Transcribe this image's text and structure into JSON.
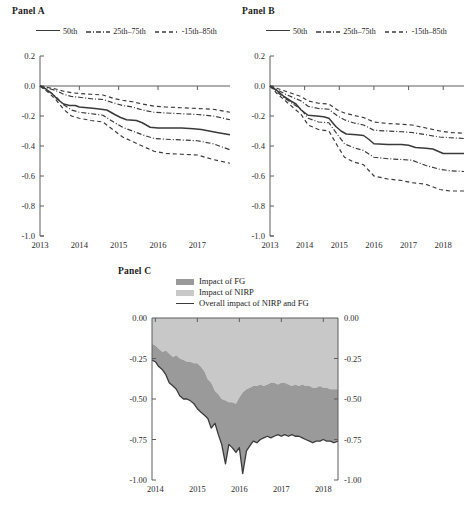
{
  "figure": {
    "panels": [
      "Panel A",
      "Panel B",
      "Panel C"
    ]
  },
  "panel_a": {
    "title": "Panel A",
    "legend": [
      {
        "label": "50th",
        "style": "solid"
      },
      {
        "label": "25th–75th",
        "style": "dash-dot"
      },
      {
        "label": "-15th–85th",
        "style": "dashed"
      }
    ]
  },
  "panel_b": {
    "title": "Panel B",
    "legend": [
      {
        "label": "50th",
        "style": "solid"
      },
      {
        "label": "25th–75th",
        "style": "dash-dot"
      },
      {
        "label": "-15th–85th",
        "style": "dashed"
      }
    ]
  },
  "panel_c": {
    "title": "Panel C",
    "legend": [
      {
        "label": "Impact of FG",
        "style": "area",
        "color": "#9a9a9a"
      },
      {
        "label": "Impact of NIRP",
        "style": "area",
        "color": "#c8c8c8"
      },
      {
        "label": "Overall impact of NIRP and FG",
        "style": "line",
        "color": "#3a3a3a"
      }
    ]
  },
  "chart_data": [
    {
      "id": "panel_a",
      "type": "line",
      "title": "Panel A",
      "xlabel": "",
      "ylabel": "",
      "xlim": [
        2013.0,
        2017.83
      ],
      "ylim": [
        -1.0,
        0.2
      ],
      "xticks": [
        "2013",
        "2014",
        "2015",
        "2016",
        "2017"
      ],
      "xtick_values": [
        2013,
        2014,
        2015,
        2016,
        2017
      ],
      "yticks": [
        "0.2",
        "0.0",
        "-0.2",
        "-0.4",
        "-0.6",
        "-0.8",
        "-1.0"
      ],
      "ytick_values": [
        0.2,
        0.0,
        -0.2,
        -0.4,
        -0.6,
        -0.8,
        -1.0
      ],
      "grid": false,
      "legend_position": "top",
      "zero_line": 0.0,
      "series": [
        {
          "name": "50th",
          "style": "solid",
          "x": [
            2013.0,
            2013.15,
            2013.3,
            2013.45,
            2013.6,
            2013.75,
            2013.9,
            2014.0,
            2014.2,
            2014.4,
            2014.55,
            2014.7,
            2014.9,
            2015.05,
            2015.2,
            2015.45,
            2015.6,
            2015.8,
            2016.0,
            2016.3,
            2016.6,
            2016.9,
            2017.1,
            2017.3,
            2017.5,
            2017.83
          ],
          "values": [
            0.0,
            -0.02,
            -0.05,
            -0.09,
            -0.12,
            -0.13,
            -0.13,
            -0.14,
            -0.145,
            -0.15,
            -0.155,
            -0.16,
            -0.19,
            -0.21,
            -0.225,
            -0.23,
            -0.245,
            -0.275,
            -0.28,
            -0.28,
            -0.28,
            -0.285,
            -0.29,
            -0.3,
            -0.31,
            -0.325
          ]
        },
        {
          "name": "75th",
          "style": "dash-dot",
          "x": [
            2013.0,
            2013.2,
            2013.4,
            2013.6,
            2013.8,
            2014.0,
            2014.3,
            2014.6,
            2014.9,
            2015.1,
            2015.35,
            2015.6,
            2015.9,
            2016.2,
            2016.6,
            2017.0,
            2017.4,
            2017.83
          ],
          "values": [
            0.0,
            -0.015,
            -0.03,
            -0.055,
            -0.07,
            -0.075,
            -0.085,
            -0.09,
            -0.115,
            -0.13,
            -0.14,
            -0.16,
            -0.175,
            -0.18,
            -0.185,
            -0.19,
            -0.2,
            -0.225
          ]
        },
        {
          "name": "25th",
          "style": "dash-dot",
          "x": [
            2013.0,
            2013.2,
            2013.4,
            2013.6,
            2013.8,
            2014.0,
            2014.3,
            2014.6,
            2014.9,
            2015.1,
            2015.35,
            2015.6,
            2015.9,
            2016.2,
            2016.6,
            2017.0,
            2017.4,
            2017.83
          ],
          "values": [
            0.0,
            -0.03,
            -0.07,
            -0.125,
            -0.16,
            -0.175,
            -0.185,
            -0.195,
            -0.245,
            -0.275,
            -0.3,
            -0.325,
            -0.35,
            -0.355,
            -0.36,
            -0.365,
            -0.385,
            -0.425
          ]
        },
        {
          "name": "85th",
          "style": "dashed",
          "x": [
            2013.0,
            2013.2,
            2013.4,
            2013.6,
            2013.8,
            2014.0,
            2014.3,
            2014.6,
            2014.9,
            2015.1,
            2015.35,
            2015.6,
            2015.9,
            2016.2,
            2016.6,
            2017.0,
            2017.4,
            2017.83
          ],
          "values": [
            0.0,
            -0.01,
            -0.02,
            -0.035,
            -0.045,
            -0.05,
            -0.055,
            -0.06,
            -0.085,
            -0.095,
            -0.105,
            -0.12,
            -0.135,
            -0.14,
            -0.145,
            -0.15,
            -0.155,
            -0.175
          ]
        },
        {
          "name": "15th",
          "style": "dashed",
          "x": [
            2013.0,
            2013.2,
            2013.4,
            2013.6,
            2013.8,
            2014.0,
            2014.3,
            2014.6,
            2014.9,
            2015.1,
            2015.35,
            2015.6,
            2015.9,
            2016.2,
            2016.6,
            2017.0,
            2017.4,
            2017.83
          ],
          "values": [
            0.0,
            -0.04,
            -0.09,
            -0.155,
            -0.2,
            -0.215,
            -0.23,
            -0.24,
            -0.3,
            -0.34,
            -0.37,
            -0.4,
            -0.435,
            -0.45,
            -0.455,
            -0.46,
            -0.49,
            -0.515
          ]
        }
      ]
    },
    {
      "id": "panel_b",
      "type": "line",
      "title": "Panel B",
      "xlabel": "",
      "ylabel": "",
      "xlim": [
        2013.0,
        2018.6
      ],
      "ylim": [
        -1.0,
        0.2
      ],
      "xticks": [
        "2013",
        "2014",
        "2015",
        "2016",
        "2017",
        "2018"
      ],
      "xtick_values": [
        2013,
        2014,
        2015,
        2016,
        2017,
        2018
      ],
      "yticks": [
        "0.2",
        "0.0",
        "-0.2",
        "-0.4",
        "-0.6",
        "-0.8",
        "-1.0"
      ],
      "ytick_values": [
        0.2,
        0.0,
        -0.2,
        -0.4,
        -0.6,
        -0.8,
        -1.0
      ],
      "grid": false,
      "legend_position": "top",
      "zero_line": 0.0,
      "series": [
        {
          "name": "50th",
          "style": "solid",
          "x": [
            2013.0,
            2013.2,
            2013.4,
            2013.6,
            2013.75,
            2013.9,
            2014.1,
            2014.35,
            2014.55,
            2014.7,
            2014.9,
            2015.05,
            2015.2,
            2015.5,
            2015.7,
            2015.85,
            2016.0,
            2016.4,
            2016.8,
            2017.0,
            2017.2,
            2017.5,
            2017.7,
            2018.0,
            2018.3,
            2018.6
          ],
          "values": [
            0.0,
            -0.03,
            -0.07,
            -0.1,
            -0.12,
            -0.16,
            -0.195,
            -0.2,
            -0.205,
            -0.215,
            -0.27,
            -0.3,
            -0.32,
            -0.325,
            -0.33,
            -0.355,
            -0.385,
            -0.39,
            -0.39,
            -0.395,
            -0.41,
            -0.415,
            -0.42,
            -0.45,
            -0.45,
            -0.45
          ]
        },
        {
          "name": "75th",
          "style": "dash-dot",
          "x": [
            2013.0,
            2013.2,
            2013.45,
            2013.7,
            2013.9,
            2014.1,
            2014.4,
            2014.7,
            2014.95,
            2015.15,
            2015.4,
            2015.7,
            2016.0,
            2016.4,
            2016.8,
            2017.1,
            2017.5,
            2017.9,
            2018.2,
            2018.6
          ],
          "values": [
            0.0,
            -0.025,
            -0.055,
            -0.08,
            -0.1,
            -0.135,
            -0.15,
            -0.155,
            -0.2,
            -0.225,
            -0.245,
            -0.26,
            -0.295,
            -0.3,
            -0.305,
            -0.31,
            -0.325,
            -0.34,
            -0.345,
            -0.35
          ]
        },
        {
          "name": "25th",
          "style": "dash-dot",
          "x": [
            2013.0,
            2013.2,
            2013.45,
            2013.7,
            2013.9,
            2014.1,
            2014.4,
            2014.7,
            2014.95,
            2015.15,
            2015.4,
            2015.7,
            2016.0,
            2016.4,
            2016.8,
            2017.1,
            2017.5,
            2017.9,
            2018.2,
            2018.6
          ],
          "values": [
            0.0,
            -0.04,
            -0.085,
            -0.125,
            -0.155,
            -0.215,
            -0.24,
            -0.245,
            -0.325,
            -0.385,
            -0.41,
            -0.43,
            -0.475,
            -0.485,
            -0.49,
            -0.495,
            -0.53,
            -0.555,
            -0.565,
            -0.57
          ]
        },
        {
          "name": "85th",
          "style": "dashed",
          "x": [
            2013.0,
            2013.2,
            2013.45,
            2013.7,
            2013.9,
            2014.1,
            2014.4,
            2014.7,
            2014.95,
            2015.15,
            2015.4,
            2015.7,
            2016.0,
            2016.4,
            2016.8,
            2017.1,
            2017.5,
            2017.9,
            2018.2,
            2018.6
          ],
          "values": [
            0.0,
            -0.015,
            -0.035,
            -0.055,
            -0.07,
            -0.1,
            -0.115,
            -0.12,
            -0.16,
            -0.18,
            -0.195,
            -0.21,
            -0.24,
            -0.25,
            -0.255,
            -0.26,
            -0.28,
            -0.3,
            -0.31,
            -0.315
          ]
        },
        {
          "name": "15th",
          "style": "dashed",
          "x": [
            2013.0,
            2013.2,
            2013.45,
            2013.7,
            2013.9,
            2014.1,
            2014.4,
            2014.7,
            2014.95,
            2015.15,
            2015.4,
            2015.7,
            2016.0,
            2016.4,
            2016.8,
            2017.1,
            2017.5,
            2017.9,
            2018.2,
            2018.6
          ],
          "values": [
            0.0,
            -0.05,
            -0.1,
            -0.15,
            -0.19,
            -0.26,
            -0.29,
            -0.3,
            -0.4,
            -0.475,
            -0.505,
            -0.525,
            -0.6,
            -0.62,
            -0.63,
            -0.645,
            -0.655,
            -0.69,
            -0.7,
            -0.7
          ]
        }
      ]
    },
    {
      "id": "panel_c",
      "type": "area",
      "title": "Panel C",
      "xlabel": "",
      "ylabel": "",
      "xlim": [
        2013.92,
        2018.35
      ],
      "ylim": [
        -1.0,
        0.0
      ],
      "xticks": [
        "2014",
        "2015",
        "2016",
        "2017",
        "2018"
      ],
      "xtick_values": [
        2014,
        2015,
        2016,
        2017,
        2018
      ],
      "yticks": [
        "0.00",
        "-0.25",
        "-0.50",
        "-0.75",
        "-1.00"
      ],
      "ytick_values": [
        0.0,
        -0.25,
        -0.5,
        -0.75,
        -1.0
      ],
      "yticks_right": [
        "0.00",
        "-0.25",
        "-0.50",
        "-0.75",
        "-1.00"
      ],
      "grid": false,
      "legend_position": "top",
      "stacked": true,
      "x": [
        2013.92,
        2014.0,
        2014.08,
        2014.17,
        2014.25,
        2014.33,
        2014.42,
        2014.5,
        2014.58,
        2014.67,
        2014.75,
        2014.83,
        2014.92,
        2015.0,
        2015.08,
        2015.17,
        2015.25,
        2015.33,
        2015.42,
        2015.5,
        2015.58,
        2015.67,
        2015.75,
        2015.83,
        2015.92,
        2016.0,
        2016.08,
        2016.17,
        2016.25,
        2016.33,
        2016.42,
        2016.5,
        2016.58,
        2016.67,
        2016.75,
        2016.83,
        2016.92,
        2017.0,
        2017.08,
        2017.17,
        2017.25,
        2017.33,
        2017.42,
        2017.5,
        2017.58,
        2017.67,
        2017.75,
        2017.83,
        2017.92,
        2018.0,
        2018.08,
        2018.17,
        2018.25,
        2018.35
      ],
      "series": [
        {
          "name": "Impact of NIRP",
          "color": "#c8c8c8",
          "description": "upper light band: from 0.00 down to the FG boundary",
          "boundary": [
            -0.16,
            -0.17,
            -0.19,
            -0.21,
            -0.2,
            -0.22,
            -0.24,
            -0.23,
            -0.25,
            -0.26,
            -0.27,
            -0.27,
            -0.28,
            -0.28,
            -0.3,
            -0.33,
            -0.38,
            -0.4,
            -0.45,
            -0.47,
            -0.5,
            -0.51,
            -0.52,
            -0.52,
            -0.53,
            -0.49,
            -0.46,
            -0.44,
            -0.43,
            -0.42,
            -0.42,
            -0.41,
            -0.42,
            -0.41,
            -0.4,
            -0.4,
            -0.41,
            -0.4,
            -0.4,
            -0.41,
            -0.42,
            -0.41,
            -0.42,
            -0.41,
            -0.42,
            -0.42,
            -0.43,
            -0.43,
            -0.42,
            -0.43,
            -0.43,
            -0.44,
            -0.44,
            -0.44
          ]
        },
        {
          "name": "Impact of FG",
          "color": "#9a9a9a",
          "description": "lower dark band: from the NIRP boundary down to the overall impact line"
        },
        {
          "name": "Overall impact of NIRP and FG",
          "color": "#3a3a3a",
          "style": "solid",
          "values": [
            -0.26,
            -0.27,
            -0.3,
            -0.32,
            -0.35,
            -0.4,
            -0.42,
            -0.44,
            -0.48,
            -0.5,
            -0.5,
            -0.51,
            -0.53,
            -0.56,
            -0.58,
            -0.6,
            -0.62,
            -0.68,
            -0.65,
            -0.72,
            -0.78,
            -0.9,
            -0.78,
            -0.8,
            -0.83,
            -0.8,
            -0.96,
            -0.82,
            -0.79,
            -0.76,
            -0.77,
            -0.75,
            -0.74,
            -0.73,
            -0.74,
            -0.73,
            -0.72,
            -0.73,
            -0.72,
            -0.73,
            -0.72,
            -0.73,
            -0.73,
            -0.74,
            -0.75,
            -0.76,
            -0.77,
            -0.76,
            -0.76,
            -0.75,
            -0.76,
            -0.76,
            -0.77,
            -0.76
          ]
        }
      ]
    }
  ]
}
